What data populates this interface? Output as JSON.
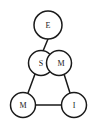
{
  "diagram": {
    "type": "node-link-graph",
    "width": 95,
    "height": 128,
    "background_color": "#ffffff",
    "stroke_color": "#1a1a1a",
    "node_fill_color": "#ffffff",
    "nodes": [
      {
        "id": "e",
        "label": "E",
        "cx": 48,
        "cy": 25,
        "r": 14
      },
      {
        "id": "s",
        "label": "S",
        "cx": 41,
        "cy": 63,
        "r": 12.5
      },
      {
        "id": "m2",
        "label": "M",
        "cx": 59,
        "cy": 63,
        "r": 12.5
      },
      {
        "id": "m1",
        "label": "M",
        "cx": 23,
        "cy": 105,
        "r": 12.5
      },
      {
        "id": "i",
        "label": "I",
        "cx": 74,
        "cy": 105,
        "r": 12.5
      }
    ],
    "edges": [
      {
        "id": "edge-e-s",
        "from": "E",
        "to": "S",
        "x1": 48,
        "y1": 39,
        "x2": 43,
        "y2": 51
      },
      {
        "id": "edge-s-m1",
        "from": "S",
        "to": "M",
        "x1": 35,
        "y1": 74,
        "x2": 28,
        "y2": 93
      },
      {
        "id": "edge-m2-i",
        "from": "M",
        "to": "I",
        "x1": 64,
        "y1": 74,
        "x2": 70,
        "y2": 93
      },
      {
        "id": "edge-m1-i",
        "from": "M",
        "to": "I",
        "x1": 36,
        "y1": 105,
        "x2": 61,
        "y2": 105
      }
    ]
  }
}
